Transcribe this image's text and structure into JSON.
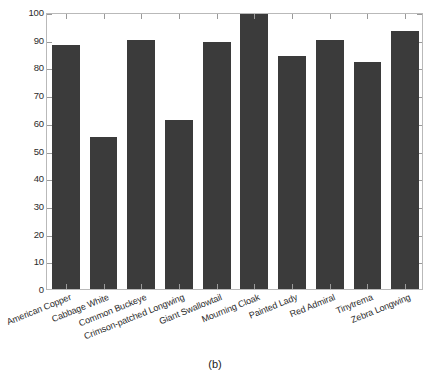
{
  "figure": {
    "caption": "(b)"
  },
  "chart_data": {
    "type": "bar",
    "title": "",
    "subtitle": "",
    "xlabel": "",
    "ylabel": "",
    "categories": [
      "American Copper",
      "Cabbage White",
      "Common Buckeye",
      "Crimson-patched Longwing",
      "Giant Swallowtail",
      "Mourning Cloak",
      "Painted Lady",
      "Red Admiral",
      "Tinytrema",
      "Zebra Longwing"
    ],
    "values": [
      88,
      55,
      90,
      61,
      89,
      100,
      84,
      90,
      82,
      93
    ],
    "ylim": [
      0,
      100
    ],
    "ytick_labels": [
      "0",
      "10",
      "20",
      "30",
      "40",
      "50",
      "60",
      "70",
      "80",
      "90",
      "100"
    ],
    "ytick_values": [
      0,
      10,
      20,
      30,
      40,
      50,
      60,
      70,
      80,
      90,
      100
    ],
    "grid": false,
    "legend": [],
    "legend_position": "none",
    "bar_color": "#3b3b3b",
    "axis_color": "#b9b9b9",
    "annotations": []
  }
}
